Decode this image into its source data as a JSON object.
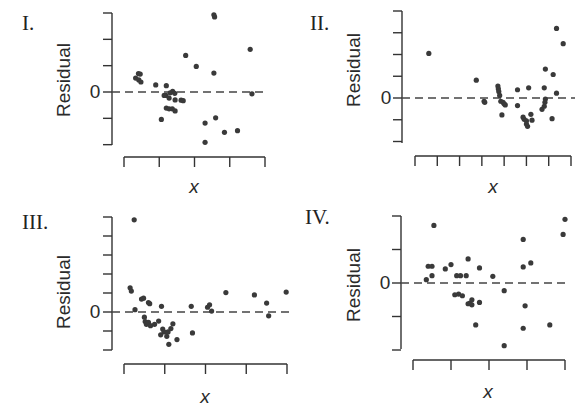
{
  "chart_data": [
    {
      "type": "scatter",
      "panel_label": "I.",
      "title": "",
      "xlabel": "x",
      "ylabel": "Residual",
      "y_tick_labels": [
        "0"
      ],
      "zero_line": "dashed",
      "x_ticks": 5,
      "y_ticks": [
        3,
        2,
        1,
        0,
        -1,
        -2
      ],
      "xlim": [
        0,
        4
      ],
      "ylim": [
        -2,
        3
      ],
      "points": [
        [
          0.41,
          0.7
        ],
        [
          0.46,
          0.68
        ],
        [
          0.33,
          0.53
        ],
        [
          0.42,
          0.46
        ],
        [
          0.48,
          0.38
        ],
        [
          0.9,
          0.27
        ],
        [
          1.2,
          0.24
        ],
        [
          1.31,
          -0.03
        ],
        [
          1.38,
          0.02
        ],
        [
          1.44,
          -0.05
        ],
        [
          1.19,
          -0.13
        ],
        [
          1.14,
          -0.13
        ],
        [
          1.28,
          -0.23
        ],
        [
          1.45,
          -0.3
        ],
        [
          1.62,
          -0.31
        ],
        [
          1.68,
          -0.33
        ],
        [
          1.2,
          -0.61
        ],
        [
          1.28,
          -0.64
        ],
        [
          1.37,
          -0.64
        ],
        [
          1.45,
          -0.72
        ],
        [
          1.06,
          -1.04
        ],
        [
          1.75,
          1.39
        ],
        [
          2.05,
          0.97
        ],
        [
          2.55,
          2.93
        ],
        [
          2.57,
          2.85
        ],
        [
          2.55,
          0.72
        ],
        [
          2.6,
          -0.98
        ],
        [
          2.3,
          -1.18
        ],
        [
          2.3,
          -1.91
        ],
        [
          2.85,
          -1.53
        ],
        [
          3.22,
          -1.47
        ],
        [
          3.58,
          1.62
        ],
        [
          3.63,
          -0.07
        ]
      ]
    },
    {
      "type": "scatter",
      "panel_label": "II.",
      "title": "",
      "xlabel": "x",
      "ylabel": "Residual",
      "y_tick_labels": [
        "0"
      ],
      "zero_line": "dashed",
      "x_ticks": 8,
      "y_ticks": [
        4,
        3,
        2,
        1,
        0,
        -1,
        -2
      ],
      "xlim": [
        0,
        7
      ],
      "ylim": [
        -2,
        4
      ],
      "points": [
        [
          0.62,
          2.05
        ],
        [
          2.75,
          0.82
        ],
        [
          3.1,
          -0.15
        ],
        [
          3.13,
          -0.2
        ],
        [
          3.72,
          0.55
        ],
        [
          3.74,
          0.42
        ],
        [
          3.76,
          0.3
        ],
        [
          3.8,
          0.12
        ],
        [
          3.85,
          -0.15
        ],
        [
          3.95,
          -0.2
        ],
        [
          4.05,
          -0.32
        ],
        [
          4.0,
          -0.27
        ],
        [
          3.9,
          -0.78
        ],
        [
          4.6,
          0.38
        ],
        [
          4.6,
          -0.35
        ],
        [
          4.85,
          -0.88
        ],
        [
          4.9,
          -0.98
        ],
        [
          5.0,
          -1.05
        ],
        [
          5.0,
          -1.2
        ],
        [
          5.05,
          -1.3
        ],
        [
          5.2,
          -0.75
        ],
        [
          5.25,
          -1.02
        ],
        [
          5.1,
          0.47
        ],
        [
          5.8,
          0.47
        ],
        [
          5.85,
          -0.05
        ],
        [
          5.83,
          -0.2
        ],
        [
          5.8,
          -0.38
        ],
        [
          5.7,
          -0.52
        ],
        [
          5.85,
          1.33
        ],
        [
          6.2,
          1.08
        ],
        [
          6.15,
          -0.95
        ],
        [
          6.35,
          3.2
        ],
        [
          6.65,
          2.5
        ],
        [
          6.35,
          0.22
        ]
      ]
    },
    {
      "type": "scatter",
      "panel_label": "III.",
      "title": "",
      "xlabel": "x",
      "ylabel": "Residual",
      "y_tick_labels": [
        "0"
      ],
      "zero_line": "dashed",
      "x_ticks": 5,
      "y_ticks": [
        5,
        4,
        3,
        2,
        1,
        0,
        -1,
        -2
      ],
      "xlim": [
        0,
        4
      ],
      "ylim": [
        -2,
        5
      ],
      "points": [
        [
          0.25,
          4.85
        ],
        [
          0.15,
          1.27
        ],
        [
          0.18,
          1.1
        ],
        [
          0.27,
          0.12
        ],
        [
          0.43,
          0.68
        ],
        [
          0.48,
          0.73
        ],
        [
          0.6,
          0.5
        ],
        [
          0.63,
          0.44
        ],
        [
          0.5,
          -0.27
        ],
        [
          0.52,
          -0.5
        ],
        [
          0.55,
          -0.65
        ],
        [
          0.6,
          -0.55
        ],
        [
          0.65,
          -0.72
        ],
        [
          0.75,
          -0.65
        ],
        [
          0.85,
          -0.48
        ],
        [
          0.95,
          -0.9
        ],
        [
          0.98,
          -1.05
        ],
        [
          0.9,
          -1.2
        ],
        [
          1.05,
          -1.28
        ],
        [
          1.08,
          -1.05
        ],
        [
          1.15,
          -0.87
        ],
        [
          1.2,
          -0.62
        ],
        [
          0.92,
          0.3
        ],
        [
          1.1,
          -1.7
        ],
        [
          1.3,
          -1.45
        ],
        [
          1.65,
          0.3
        ],
        [
          1.68,
          -1.1
        ],
        [
          2.05,
          0.25
        ],
        [
          2.1,
          0.38
        ],
        [
          2.15,
          0.05
        ],
        [
          2.5,
          1.02
        ],
        [
          3.2,
          0.9
        ],
        [
          3.5,
          0.47
        ],
        [
          3.55,
          -0.2
        ],
        [
          3.98,
          1.05
        ]
      ]
    },
    {
      "type": "scatter",
      "panel_label": "IV.",
      "title": "",
      "xlabel": "x",
      "ylabel": "Residual",
      "y_tick_labels": [
        "0"
      ],
      "zero_line": "dashed",
      "x_ticks": 5,
      "y_ticks": [
        2,
        1,
        0,
        -1,
        -2
      ],
      "xlim": [
        0,
        4
      ],
      "ylim": [
        -2,
        2
      ],
      "points": [
        [
          0.35,
          0.1
        ],
        [
          0.4,
          0.5
        ],
        [
          0.5,
          0.5
        ],
        [
          0.5,
          0.22
        ],
        [
          0.55,
          1.72
        ],
        [
          0.85,
          0.42
        ],
        [
          1.0,
          0.55
        ],
        [
          1.15,
          0.22
        ],
        [
          1.25,
          0.22
        ],
        [
          1.4,
          0.22
        ],
        [
          1.1,
          -0.35
        ],
        [
          1.2,
          -0.33
        ],
        [
          1.3,
          -0.38
        ],
        [
          1.45,
          -0.62
        ],
        [
          1.5,
          -0.6
        ],
        [
          1.55,
          -0.5
        ],
        [
          1.55,
          -0.65
        ],
        [
          1.45,
          0.72
        ],
        [
          1.75,
          0.45
        ],
        [
          1.75,
          -0.58
        ],
        [
          1.65,
          -1.25
        ],
        [
          2.1,
          0.2
        ],
        [
          2.4,
          -0.23
        ],
        [
          2.4,
          -1.87
        ],
        [
          2.9,
          1.3
        ],
        [
          2.9,
          0.48
        ],
        [
          3.1,
          0.6
        ],
        [
          2.95,
          -0.68
        ],
        [
          2.9,
          -1.35
        ],
        [
          3.6,
          -1.25
        ],
        [
          3.95,
          1.45
        ],
        [
          4.0,
          1.9
        ]
      ]
    }
  ]
}
